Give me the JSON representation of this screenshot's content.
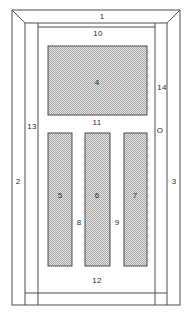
{
  "figure": {
    "type": "patent-line-drawing",
    "background_color": "#ffffff",
    "line_color": "#3a3a3a",
    "panel_fill_color": "#dcdcdc",
    "panel_stipple_color": "#9a9a9a",
    "label_color": "#2b2b2b"
  },
  "outer_frame": {
    "x": 12,
    "y": 10,
    "width": 168,
    "height": 295,
    "bevel": 13,
    "name": "door-outer-casing"
  },
  "inner_frame": {
    "x": 25,
    "y": 23,
    "width": 142,
    "height": 282,
    "name": "door-leaf"
  },
  "panels": [
    {
      "id": "upper-panel",
      "label": "4",
      "x": 48,
      "y": 46,
      "width": 99,
      "height": 69,
      "label_x": 97,
      "label_y": 83
    },
    {
      "id": "lower-panel-left",
      "label": "5",
      "x": 48,
      "y": 133,
      "width": 24,
      "height": 133,
      "label_x": 60,
      "label_y": 196
    },
    {
      "id": "lower-panel-center",
      "label": "6",
      "x": 85,
      "y": 133,
      "width": 25,
      "height": 133,
      "label_x": 97,
      "label_y": 196
    },
    {
      "id": "lower-panel-right",
      "label": "7",
      "x": 124,
      "y": 133,
      "width": 23,
      "height": 133,
      "label_x": 135,
      "label_y": 196
    }
  ],
  "reference_labels": [
    {
      "id": "ref-1",
      "text": "1",
      "x": 102,
      "y": 17,
      "name": "reference-label-1-top-rail"
    },
    {
      "id": "ref-10",
      "text": "10",
      "x": 98,
      "y": 34,
      "name": "reference-label-10-upper-rail"
    },
    {
      "id": "ref-4",
      "text": "4",
      "x": 97,
      "y": 83,
      "name": "reference-label-4-upper-panel"
    },
    {
      "id": "ref-14",
      "text": "14",
      "x": 162,
      "y": 88,
      "name": "reference-label-14-right-edge"
    },
    {
      "id": "ref-11",
      "text": "11",
      "x": 97,
      "y": 123,
      "name": "reference-label-11-mid-rail"
    },
    {
      "id": "ref-13",
      "text": "13",
      "x": 32,
      "y": 127,
      "name": "reference-label-13-left-edge"
    },
    {
      "id": "ref-0",
      "text": "O",
      "x": 160,
      "y": 131,
      "name": "reference-label-0-right-edge"
    },
    {
      "id": "ref-2",
      "text": "2",
      "x": 18,
      "y": 182,
      "name": "reference-label-2-left-stile"
    },
    {
      "id": "ref-3",
      "text": "3",
      "x": 174,
      "y": 182,
      "name": "reference-label-3-right-stile"
    },
    {
      "id": "ref-5",
      "text": "5",
      "x": 60,
      "y": 196,
      "name": "reference-label-5-left-panel"
    },
    {
      "id": "ref-6",
      "text": "6",
      "x": 97,
      "y": 196,
      "name": "reference-label-6-center-panel"
    },
    {
      "id": "ref-7",
      "text": "7",
      "x": 135,
      "y": 196,
      "name": "reference-label-7-right-panel"
    },
    {
      "id": "ref-8",
      "text": "8",
      "x": 79,
      "y": 223,
      "name": "reference-label-8-left-muntin"
    },
    {
      "id": "ref-9",
      "text": "9",
      "x": 117,
      "y": 223,
      "name": "reference-label-9-right-muntin"
    },
    {
      "id": "ref-12",
      "text": "12",
      "x": 97,
      "y": 281,
      "name": "reference-label-12-bottom-rail"
    }
  ]
}
